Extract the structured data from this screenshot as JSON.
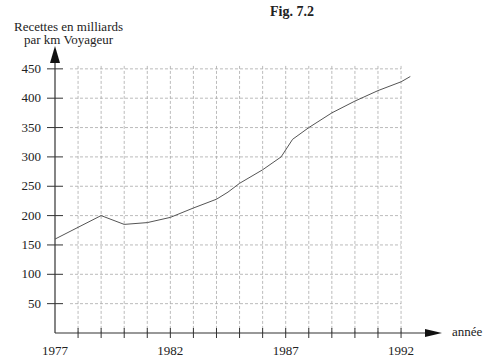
{
  "figure": {
    "title": "Fig. 7.2",
    "ylabel_line1": "Recettes en milliards",
    "ylabel_line2": "par km Voyageur",
    "xlabel": "année"
  },
  "chart_data": {
    "type": "line",
    "title": "Fig. 7.2",
    "xlabel": "année",
    "ylabel": "Recettes en milliards par km Voyageur",
    "xlim": [
      1977,
      1993
    ],
    "ylim": [
      0,
      450
    ],
    "x_tick_labels": [
      "1977",
      "1982",
      "1987",
      "1992"
    ],
    "y_tick_labels": [
      "50",
      "100",
      "150",
      "200",
      "250",
      "300",
      "350",
      "400",
      "450"
    ],
    "grid": true,
    "grid_style": "dashed",
    "series": [
      {
        "name": "Recettes",
        "x": [
          1977,
          1978,
          1979,
          1980,
          1981,
          1982,
          1983,
          1984,
          1984.5,
          1985,
          1986,
          1986.8,
          1987.3,
          1988,
          1989,
          1990,
          1991,
          1992,
          1992.4
        ],
        "values": [
          160,
          180,
          200,
          185,
          188,
          197,
          213,
          228,
          240,
          255,
          278,
          300,
          330,
          350,
          375,
          395,
          413,
          428,
          437
        ]
      }
    ]
  },
  "colors": {
    "line": "#555555",
    "axis": "#333333",
    "grid": "#aaaaaa"
  }
}
